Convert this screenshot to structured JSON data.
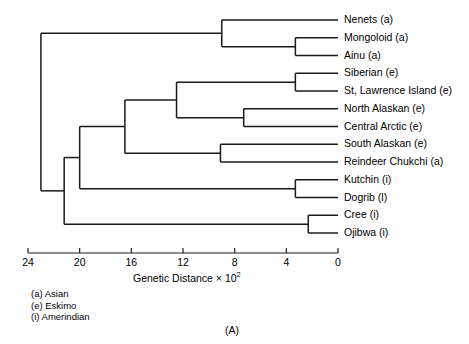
{
  "figure": {
    "panel_label": "(A)",
    "axis": {
      "title_main": "Genetic Distance × 10",
      "title_exponent": "2",
      "tick_labels": [
        "24",
        "20",
        "16",
        "12",
        "8",
        "4",
        "0"
      ],
      "tick_values": [
        24,
        20,
        16,
        12,
        8,
        4,
        0
      ],
      "min": 0,
      "max": 24
    },
    "legend": [
      "(a) Asian",
      "(e) Eskimo",
      "(i) Amerindian"
    ],
    "leaves": [
      {
        "label": "Nenets (a)",
        "group": "a"
      },
      {
        "label": "Mongoloid (a)",
        "group": "a"
      },
      {
        "label": "Ainu (a)",
        "group": "a"
      },
      {
        "label": "Siberian (e)",
        "group": "e"
      },
      {
        "label": "St, Lawrence Island (e)",
        "group": "e"
      },
      {
        "label": "North Alaskan (e)",
        "group": "e"
      },
      {
        "label": "Central Arctic (e)",
        "group": "e"
      },
      {
        "label": "South Alaskan (e)",
        "group": "e"
      },
      {
        "label": "Reindeer Chukchi (a)",
        "group": "a"
      },
      {
        "label": "Kutchin (i)",
        "group": "i"
      },
      {
        "label": "Dogrib (l)",
        "group": "i"
      },
      {
        "label": "Cree (i)",
        "group": "i"
      },
      {
        "label": "Ojibwa (i)",
        "group": "i"
      }
    ]
  },
  "chart_data": {
    "type": "dendrogram",
    "title": "(A)",
    "xlabel": "Genetic Distance × 10^2",
    "ylabel": "",
    "xlim": [
      24,
      0
    ],
    "x_ticks": [
      24,
      20,
      16,
      12,
      8,
      4,
      0
    ],
    "x_axis_reversed": true,
    "grid": false,
    "legend_position": "below-axis-left",
    "legend_entries": [
      "(a) Asian",
      "(e) Eskimo",
      "(i) Amerindian"
    ],
    "leaf_order": [
      "Nenets (a)",
      "Mongoloid (a)",
      "Ainu (a)",
      "Siberian (e)",
      "St, Lawrence Island (e)",
      "North Alaskan (e)",
      "Central Arctic (e)",
      "South Alaskan (e)",
      "Reindeer Chukchi (a)",
      "Kutchin (i)",
      "Dogrib (l)",
      "Cree (i)",
      "Ojibwa (i)"
    ],
    "merges": [
      {
        "name": "Mongoloid+Ainu",
        "members": [
          "Mongoloid (a)",
          "Ainu (a)"
        ],
        "distance": 3.3
      },
      {
        "name": "Asian",
        "members": [
          "Nenets (a)",
          "Mongoloid+Ainu"
        ],
        "distance": 9.0
      },
      {
        "name": "Siberian+StLawrence",
        "members": [
          "Siberian (e)",
          "St, Lawrence Island (e)"
        ],
        "distance": 3.3
      },
      {
        "name": "NorthAlaskan+CentralArctic",
        "members": [
          "North Alaskan (e)",
          "Central Arctic (e)"
        ],
        "distance": 7.3
      },
      {
        "name": "EskimoCore",
        "members": [
          "Siberian+StLawrence",
          "NorthAlaskan+CentralArctic"
        ],
        "distance": 12.5
      },
      {
        "name": "SouthAlaskan+ReindeerChukchi",
        "members": [
          "South Alaskan (e)",
          "Reindeer Chukchi (a)"
        ],
        "distance": 9.1
      },
      {
        "name": "EskimoClade",
        "members": [
          "EskimoCore",
          "SouthAlaskan+ReindeerChukchi"
        ],
        "distance": 16.5
      },
      {
        "name": "Kutchin+Dogrib",
        "members": [
          "Kutchin (i)",
          "Dogrib (l)"
        ],
        "distance": 3.3
      },
      {
        "name": "Cree+Ojibwa",
        "members": [
          "Cree (i)",
          "Ojibwa (i)"
        ],
        "distance": 2.3
      },
      {
        "name": "Eskimo+Kutchin",
        "members": [
          "EskimoClade",
          "Kutchin+Dogrib"
        ],
        "distance": 20.0
      },
      {
        "name": "NorthAmerican",
        "members": [
          "Eskimo+Kutchin",
          "Cree+Ojibwa"
        ],
        "distance": 21.2
      },
      {
        "name": "Root",
        "members": [
          "Asian",
          "NorthAmerican"
        ],
        "distance": 23.0
      }
    ]
  }
}
